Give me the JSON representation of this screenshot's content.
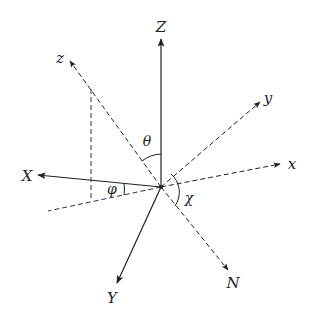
{
  "diagram": {
    "type": "coordinate-frame-rotation",
    "origin": {
      "x": 161,
      "y": 187
    },
    "axes": [
      {
        "id": "Z",
        "label": "Z",
        "style": "solid",
        "tip": {
          "x": 161,
          "y": 39
        },
        "label_pos": {
          "x": 161,
          "y": 32
        }
      },
      {
        "id": "X",
        "label": "X",
        "style": "solid",
        "tip": {
          "x": 38,
          "y": 175
        },
        "label_pos": {
          "x": 27,
          "y": 181
        }
      },
      {
        "id": "Y",
        "label": "Y",
        "style": "solid",
        "tip": {
          "x": 117,
          "y": 283
        },
        "label_pos": {
          "x": 112,
          "y": 303
        }
      },
      {
        "id": "z",
        "label": "z",
        "style": "dashed",
        "tip": {
          "x": 70,
          "y": 61
        },
        "label_pos": {
          "x": 60,
          "y": 63
        }
      },
      {
        "id": "y",
        "label": "y",
        "style": "dashed",
        "tip": {
          "x": 260,
          "y": 102
        },
        "label_pos": {
          "x": 268,
          "y": 103
        }
      },
      {
        "id": "x",
        "label": "x",
        "style": "dashed",
        "tip": {
          "x": 280,
          "y": 164
        },
        "label_pos": {
          "x": 292,
          "y": 169
        }
      },
      {
        "id": "N",
        "label": "N",
        "style": "dashed",
        "tip": {
          "x": 228,
          "y": 270
        },
        "label_pos": {
          "x": 233,
          "y": 288
        }
      }
    ],
    "projection_lines": [
      {
        "from": {
          "x": 161,
          "y": 187
        },
        "to": {
          "x": 48,
          "y": 211
        },
        "style": "dashed"
      },
      {
        "from": {
          "x": 91,
          "y": 89
        },
        "to": {
          "x": 91,
          "y": 201
        },
        "style": "dashed"
      }
    ],
    "angles": [
      {
        "id": "theta",
        "label": "θ",
        "between": [
          "z",
          "Z"
        ],
        "label_pos": {
          "x": 147,
          "y": 146
        }
      },
      {
        "id": "phi",
        "label": "φ",
        "between": [
          "X",
          "projection"
        ],
        "label_pos": {
          "x": 112,
          "y": 194
        }
      },
      {
        "id": "chi",
        "label": "χ",
        "between": [
          "x",
          "N"
        ],
        "label_pos": {
          "x": 189,
          "y": 203
        }
      }
    ],
    "colors": {
      "line": "#222222",
      "background": "#ffffff"
    }
  }
}
